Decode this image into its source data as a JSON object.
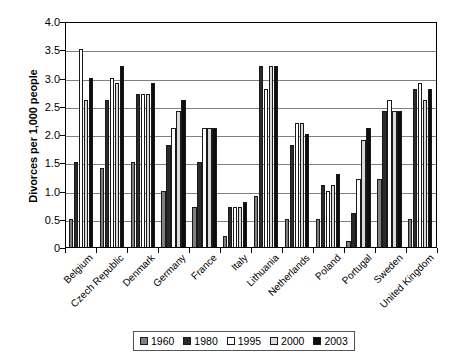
{
  "chart_data": {
    "type": "bar",
    "title": "",
    "xlabel": "",
    "ylabel": "Divorces per 1,000 people",
    "ylim": [
      0,
      4.0
    ],
    "yticks": [
      "0",
      "0.5",
      "1.0",
      "1.5",
      "2.0",
      "2.5",
      "3.0",
      "3.5",
      "4.0"
    ],
    "grid": true,
    "legend_position": "bottom",
    "categories": [
      "Belgium",
      "Czech Republic",
      "Denmark",
      "Germany",
      "France",
      "Italy",
      "Lithuania",
      "Netherlands",
      "Poland",
      "Portugal",
      "Sweden",
      "United Kingdom"
    ],
    "series": [
      {
        "name": "1960",
        "color": "#808080",
        "values": [
          0.5,
          1.4,
          1.5,
          1.0,
          0.7,
          0.2,
          0.9,
          0.5,
          0.5,
          0.1,
          1.2,
          0.5
        ]
      },
      {
        "name": "1980",
        "color": "#2b2b2b",
        "values": [
          1.5,
          2.6,
          2.7,
          1.8,
          1.5,
          0.7,
          3.2,
          1.8,
          1.1,
          0.6,
          2.4,
          2.8
        ]
      },
      {
        "name": "1995",
        "color": "#ffffff",
        "values": [
          3.5,
          3.0,
          2.7,
          2.1,
          2.1,
          0.7,
          2.8,
          2.2,
          1.0,
          1.2,
          2.6,
          2.9
        ]
      },
      {
        "name": "2000",
        "color": "#d9d9d9",
        "values": [
          2.6,
          2.9,
          2.7,
          2.4,
          2.1,
          0.7,
          3.2,
          2.2,
          1.1,
          1.9,
          2.4,
          2.6
        ]
      },
      {
        "name": "2003",
        "color": "#0d0d0d",
        "values": [
          3.0,
          3.2,
          2.9,
          2.6,
          2.1,
          0.8,
          3.2,
          2.0,
          1.3,
          2.1,
          2.4,
          2.8
        ]
      }
    ]
  }
}
